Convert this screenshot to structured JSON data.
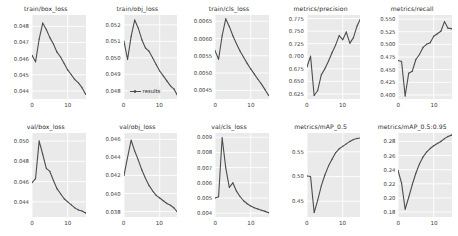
{
  "figure": {
    "kind": "training-results-grid",
    "rows": 2,
    "cols": 5,
    "series_name": "results",
    "line_color": "#4d4d4d",
    "plot_background": "#eaeaea",
    "grid_color": "#ffffff",
    "legend_panel": "train/obj_loss",
    "legend_label": "results"
  },
  "chart_data": [
    {
      "type": "line",
      "title": "train/box_loss",
      "xlabel": "",
      "ylabel": "",
      "legend": [],
      "grid": true,
      "xlim": [
        0,
        15
      ],
      "ylim": [
        0.0435,
        0.0487
      ],
      "xticks": [
        0,
        10
      ],
      "yticks": [
        0.044,
        0.045,
        0.046,
        0.047,
        0.048
      ],
      "ytick_labels": [
        "0.044",
        "0.045",
        "0.046",
        "0.047",
        "0.048"
      ],
      "x": [
        0,
        1,
        2,
        3,
        4,
        5,
        6,
        7,
        8,
        9,
        10,
        11,
        12,
        13,
        14,
        15
      ],
      "series": [
        {
          "name": "results",
          "values": [
            0.0462,
            0.0458,
            0.0472,
            0.0482,
            0.0478,
            0.0473,
            0.0469,
            0.0464,
            0.0461,
            0.0457,
            0.0453,
            0.045,
            0.0447,
            0.0445,
            0.0442,
            0.0438
          ]
        }
      ]
    },
    {
      "type": "line",
      "title": "train/obj_loss",
      "xlabel": "",
      "ylabel": "",
      "legend": [
        "results"
      ],
      "legend_position": "lower left",
      "grid": true,
      "xlim": [
        0,
        15
      ],
      "ylim": [
        0.0475,
        0.0526
      ],
      "xticks": [
        0,
        10
      ],
      "yticks": [
        0.048,
        0.049,
        0.05,
        0.051,
        0.052
      ],
      "ytick_labels": [
        "0.048",
        "0.049",
        "0.050",
        "0.051",
        "0.052"
      ],
      "x": [
        0,
        1,
        2,
        3,
        4,
        5,
        6,
        7,
        8,
        9,
        10,
        11,
        12,
        13,
        14,
        15
      ],
      "series": [
        {
          "name": "results",
          "values": [
            0.051,
            0.0499,
            0.0513,
            0.0523,
            0.0518,
            0.0511,
            0.0506,
            0.0504,
            0.05,
            0.0496,
            0.0492,
            0.0489,
            0.0486,
            0.0483,
            0.0481,
            0.0477
          ]
        }
      ]
    },
    {
      "type": "line",
      "title": "train/cls_loss",
      "xlabel": "",
      "ylabel": "",
      "legend": [],
      "grid": true,
      "xlim": [
        0,
        15
      ],
      "ylim": [
        0.00425,
        0.00668
      ],
      "xticks": [
        0,
        10
      ],
      "yticks": [
        0.0045,
        0.005,
        0.0055,
        0.006,
        0.0065
      ],
      "ytick_labels": [
        "0.0045",
        "0.0050",
        "0.0055",
        "0.0060",
        "0.0065"
      ],
      "x": [
        0,
        1,
        2,
        3,
        4,
        5,
        6,
        7,
        8,
        9,
        10,
        11,
        12,
        13,
        14,
        15
      ],
      "series": [
        {
          "name": "results",
          "values": [
            0.00565,
            0.0054,
            0.00608,
            0.00657,
            0.00635,
            0.00608,
            0.00585,
            0.00564,
            0.00546,
            0.00528,
            0.00512,
            0.00497,
            0.00482,
            0.00468,
            0.00452,
            0.00435
          ]
        }
      ]
    },
    {
      "type": "line",
      "title": "metrics/precision",
      "xlabel": "",
      "ylabel": "",
      "legend": [],
      "grid": true,
      "xlim": [
        0,
        15
      ],
      "ylim": [
        0.615,
        0.782
      ],
      "xticks": [
        0,
        10
      ],
      "yticks": [
        0.625,
        0.65,
        0.675,
        0.7,
        0.725,
        0.75,
        0.775
      ],
      "ytick_labels": [
        "0.625",
        "0.650",
        "0.675",
        "0.700",
        "0.725",
        "0.750",
        "0.775"
      ],
      "x": [
        0,
        1,
        2,
        3,
        4,
        5,
        6,
        7,
        8,
        9,
        10,
        11,
        12,
        13,
        14,
        15
      ],
      "series": [
        {
          "name": "results",
          "values": [
            0.679,
            0.7,
            0.622,
            0.632,
            0.663,
            0.675,
            0.69,
            0.707,
            0.722,
            0.741,
            0.733,
            0.748,
            0.726,
            0.737,
            0.76,
            0.775
          ]
        }
      ]
    },
    {
      "type": "line",
      "title": "metrics/recall",
      "xlabel": "",
      "ylabel": "",
      "legend": [],
      "grid": true,
      "xlim": [
        0,
        15
      ],
      "ylim": [
        0.392,
        0.558
      ],
      "xticks": [
        0,
        10
      ],
      "yticks": [
        0.4,
        0.425,
        0.45,
        0.475,
        0.5,
        0.525,
        0.55
      ],
      "ytick_labels": [
        "0.400",
        "0.425",
        "0.450",
        "0.475",
        "0.500",
        "0.525",
        "0.550"
      ],
      "x": [
        0,
        1,
        2,
        3,
        4,
        5,
        6,
        7,
        8,
        9,
        10,
        11,
        12,
        13,
        14,
        15
      ],
      "series": [
        {
          "name": "results",
          "values": [
            0.468,
            0.466,
            0.398,
            0.443,
            0.447,
            0.47,
            0.48,
            0.494,
            0.5,
            0.503,
            0.516,
            0.521,
            0.526,
            0.545,
            0.532,
            0.531
          ]
        }
      ]
    },
    {
      "type": "line",
      "title": "val/box_loss",
      "xlabel": "",
      "ylabel": "",
      "legend": [],
      "grid": true,
      "xlim": [
        0,
        15
      ],
      "ylim": [
        0.0425,
        0.0508
      ],
      "xticks": [
        0,
        10
      ],
      "yticks": [
        0.044,
        0.046,
        0.048,
        0.05
      ],
      "ytick_labels": [
        "0.044",
        "0.046",
        "0.048",
        "0.050"
      ],
      "x": [
        0,
        1,
        2,
        3,
        4,
        5,
        6,
        7,
        8,
        9,
        10,
        11,
        12,
        13,
        14,
        15
      ],
      "series": [
        {
          "name": "results",
          "values": [
            0.0459,
            0.0463,
            0.05,
            0.0487,
            0.0473,
            0.047,
            0.0461,
            0.0453,
            0.0448,
            0.0443,
            0.044,
            0.0437,
            0.0434,
            0.0432,
            0.0431,
            0.0429
          ]
        }
      ]
    },
    {
      "type": "line",
      "title": "val/obj_loss",
      "xlabel": "",
      "ylabel": "",
      "legend": [],
      "grid": true,
      "xlim": [
        0,
        15
      ],
      "ylim": [
        0.0374,
        0.0467
      ],
      "xticks": [
        0,
        10
      ],
      "yticks": [
        0.038,
        0.04,
        0.042,
        0.044,
        0.046
      ],
      "ytick_labels": [
        "0.038",
        "0.040",
        "0.042",
        "0.044",
        "0.046"
      ],
      "x": [
        0,
        1,
        2,
        3,
        4,
        5,
        6,
        7,
        8,
        9,
        10,
        11,
        12,
        13,
        14,
        15
      ],
      "series": [
        {
          "name": "results",
          "values": [
            0.042,
            0.044,
            0.0459,
            0.0447,
            0.0437,
            0.0426,
            0.0417,
            0.0409,
            0.0403,
            0.0398,
            0.0395,
            0.0392,
            0.0389,
            0.0387,
            0.0384,
            0.0379
          ]
        }
      ]
    },
    {
      "type": "line",
      "title": "val/cls_loss",
      "xlabel": "",
      "ylabel": "",
      "legend": [],
      "grid": true,
      "xlim": [
        0,
        15
      ],
      "ylim": [
        0.00375,
        0.00928
      ],
      "xticks": [
        0,
        10
      ],
      "yticks": [
        0.004,
        0.005,
        0.006,
        0.007,
        0.008,
        0.009
      ],
      "ytick_labels": [
        "0.004",
        "0.005",
        "0.006",
        "0.007",
        "0.008",
        "0.009"
      ],
      "x": [
        0,
        1,
        2,
        3,
        4,
        5,
        6,
        7,
        8,
        9,
        10,
        11,
        12,
        13,
        14,
        15
      ],
      "series": [
        {
          "name": "results",
          "values": [
            0.005,
            0.00508,
            0.00897,
            0.007,
            0.0057,
            0.006,
            0.00545,
            0.0051,
            0.00482,
            0.00462,
            0.00447,
            0.00436,
            0.00428,
            0.0042,
            0.00412,
            0.00403
          ]
        }
      ]
    },
    {
      "type": "line",
      "title": "metrics/mAP_0.5",
      "xlabel": "",
      "ylabel": "",
      "legend": [],
      "grid": true,
      "xlim": [
        0,
        15
      ],
      "ylim": [
        0.418,
        0.588
      ],
      "xticks": [
        0,
        10
      ],
      "yticks": [
        0.45,
        0.5,
        0.55
      ],
      "ytick_labels": [
        "0.45",
        "0.50",
        "0.55"
      ],
      "x": [
        0,
        1,
        2,
        3,
        4,
        5,
        6,
        7,
        8,
        9,
        10,
        11,
        12,
        13,
        14,
        15
      ],
      "series": [
        {
          "name": "results",
          "values": [
            0.501,
            0.5,
            0.427,
            0.452,
            0.481,
            0.503,
            0.521,
            0.535,
            0.548,
            0.556,
            0.561,
            0.566,
            0.571,
            0.575,
            0.577,
            0.578
          ]
        }
      ]
    },
    {
      "type": "line",
      "title": "metrics/mAP_0.5:0.95",
      "xlabel": "",
      "ylabel": "",
      "legend": [],
      "grid": true,
      "xlim": [
        0,
        15
      ],
      "ylim": [
        0.173,
        0.292
      ],
      "xticks": [
        0,
        10
      ],
      "yticks": [
        0.18,
        0.2,
        0.22,
        0.24,
        0.26,
        0.28
      ],
      "ytick_labels": [
        "0.18",
        "0.20",
        "0.22",
        "0.24",
        "0.26",
        "0.28"
      ],
      "x": [
        0,
        1,
        2,
        3,
        4,
        5,
        6,
        7,
        8,
        9,
        10,
        11,
        12,
        13,
        14,
        15
      ],
      "series": [
        {
          "name": "results",
          "values": [
            0.239,
            0.221,
            0.184,
            0.201,
            0.219,
            0.235,
            0.248,
            0.258,
            0.265,
            0.27,
            0.274,
            0.277,
            0.28,
            0.284,
            0.287,
            0.289
          ]
        }
      ]
    }
  ]
}
